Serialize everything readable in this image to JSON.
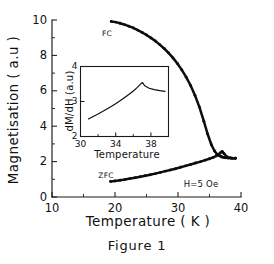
{
  "figure": {
    "caption": "Figure 1",
    "annotations": {
      "fc_label": "FC",
      "zfc_label": "ZFC",
      "field_label": "H=5  Oe"
    }
  },
  "chart_data": {
    "type": "line",
    "title": "",
    "xlabel": "Temperature  (  K  )",
    "ylabel": "Magnetisation  (  a.u  )",
    "xlim": [
      10,
      40
    ],
    "ylim": [
      0,
      10
    ],
    "xticks": [
      10,
      20,
      30,
      40
    ],
    "xtick_labels": [
      "10",
      "20",
      "30",
      "40"
    ],
    "xticks_minor": [
      15,
      25,
      35
    ],
    "yticks": [
      0,
      2,
      4,
      6,
      8,
      10
    ],
    "ytick_labels": [
      "0",
      "2",
      "4",
      "6",
      "8",
      "10"
    ],
    "yticks_minor": [
      1,
      3,
      5,
      7,
      9
    ],
    "grid": false,
    "legend_position": "inline-annotations",
    "series": [
      {
        "name": "FC",
        "marker": "filled-circle",
        "x": [
          19.4,
          20.1,
          20.8,
          21.5,
          22.2,
          22.9,
          23.6,
          24.3,
          25.0,
          25.7,
          26.4,
          27.1,
          27.8,
          28.5,
          29.2,
          29.9,
          30.6,
          31.3,
          32.0,
          32.7,
          33.4,
          34.1,
          34.7,
          35.3,
          35.8,
          36.2,
          36.5,
          36.8,
          37.0,
          37.2,
          37.5,
          38.0,
          38.6,
          39.1
        ],
        "y": [
          9.92,
          9.88,
          9.82,
          9.74,
          9.65,
          9.55,
          9.43,
          9.3,
          9.15,
          8.99,
          8.81,
          8.61,
          8.39,
          8.14,
          7.86,
          7.54,
          7.18,
          6.77,
          6.3,
          5.74,
          5.08,
          4.28,
          3.56,
          2.95,
          2.6,
          2.42,
          2.34,
          2.29,
          2.26,
          2.24,
          2.22,
          2.2,
          2.19,
          2.19
        ]
      },
      {
        "name": "ZFC",
        "marker": "filled-circle",
        "x": [
          19.3,
          20.0,
          20.8,
          21.6,
          22.4,
          23.2,
          24.0,
          24.8,
          25.6,
          26.4,
          27.2,
          28.0,
          28.8,
          29.6,
          30.4,
          31.2,
          32.0,
          32.8,
          33.6,
          34.3,
          35.0,
          35.6,
          36.1,
          36.5,
          36.8,
          37.0,
          37.3,
          37.8,
          38.4,
          39.1
        ],
        "y": [
          0.88,
          0.91,
          0.95,
          0.99,
          1.04,
          1.09,
          1.14,
          1.2,
          1.26,
          1.32,
          1.39,
          1.46,
          1.53,
          1.6,
          1.68,
          1.76,
          1.84,
          1.92,
          2.0,
          2.08,
          2.16,
          2.24,
          2.33,
          2.42,
          2.52,
          2.58,
          2.45,
          2.26,
          2.2,
          2.19
        ]
      }
    ]
  },
  "inset_chart_data": {
    "type": "line",
    "title": "",
    "xlabel": "Temperature",
    "ylabel": "dM/dH (a.u)",
    "xlim": [
      30,
      40
    ],
    "ylim": [
      2,
      4
    ],
    "xticks": [
      30,
      34,
      38
    ],
    "xtick_labels": [
      "30",
      "34",
      "38"
    ],
    "xticks_minor": [
      32,
      36,
      40
    ],
    "yticks": [
      2,
      3,
      4
    ],
    "ytick_labels": [
      "2",
      "3",
      "4"
    ],
    "grid": false,
    "series": [
      {
        "name": "dM/dH",
        "x": [
          30.9,
          31.5,
          32.1,
          32.7,
          33.3,
          33.9,
          34.5,
          35.1,
          35.6,
          36.0,
          36.4,
          36.7,
          36.9,
          37.05,
          37.3,
          37.8,
          38.4,
          39.0,
          39.6
        ],
        "y": [
          2.5,
          2.58,
          2.66,
          2.74,
          2.83,
          2.92,
          3.02,
          3.13,
          3.22,
          3.3,
          3.39,
          3.47,
          3.52,
          3.54,
          3.45,
          3.38,
          3.34,
          3.31,
          3.29
        ]
      }
    ]
  }
}
